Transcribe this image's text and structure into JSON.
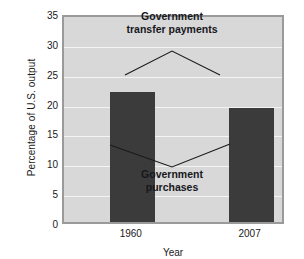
{
  "chart_data": {
    "type": "bar",
    "title": "",
    "xlabel": "Year",
    "ylabel": "Percentage of U.S. output",
    "categories": [
      "1960",
      "2007"
    ],
    "values": [
      21.7,
      19.1
    ],
    "series": [
      {
        "name": "Government purchases",
        "values": [
          21.7,
          19.1
        ]
      }
    ],
    "ylim": [
      0,
      35
    ],
    "ytick_values": [
      0,
      5,
      10,
      15,
      20,
      25,
      30,
      35
    ],
    "ytick_labels": [
      "0",
      "5",
      "10",
      "15",
      "20",
      "25",
      "30",
      "35"
    ],
    "grid": true,
    "legend_position": "none",
    "annotations": [
      {
        "id": "transfer",
        "lines": [
          "Government",
          "transfer payments"
        ],
        "leader": "inverted-v-pointing-to-both-bars"
      },
      {
        "id": "purchases",
        "lines": [
          "Government",
          "purchases"
        ],
        "leader": "v-pointing-to-both-bars"
      }
    ],
    "colors": {
      "bar": "#3b3b3b",
      "plot_background": "#d8d8d8",
      "gridline": "#f4f4f4",
      "frame": "#9a9a9a",
      "text": "#1a1a1a",
      "annotation_text": "#17171c",
      "leader_line": "#1a1a1a"
    }
  }
}
